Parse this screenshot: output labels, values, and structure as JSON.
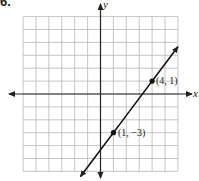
{
  "problem_number": "6.",
  "chart_data": {
    "type": "line",
    "title": "",
    "xlabel": "x",
    "ylabel": "y",
    "xlim": [
      -6,
      6
    ],
    "ylim": [
      -6,
      6
    ],
    "grid": true,
    "series": [
      {
        "name": "line through (1, -3) and (4, 1)",
        "points": [
          [
            1,
            -3
          ],
          [
            4,
            1
          ]
        ],
        "slope": 1.3333,
        "intercept": -4.3333
      }
    ],
    "annotations": [
      {
        "text": "(4, 1)",
        "x": 4,
        "y": 1
      },
      {
        "text": "(1, −3)",
        "x": 1,
        "y": -3
      }
    ]
  },
  "labels": {
    "x_axis": "x",
    "y_axis": "y",
    "point_a": "(4, 1)",
    "point_b": "(1, −3)"
  },
  "colors": {
    "grid": "#b8b8b8",
    "axis": "#222222",
    "line": "#111111"
  }
}
